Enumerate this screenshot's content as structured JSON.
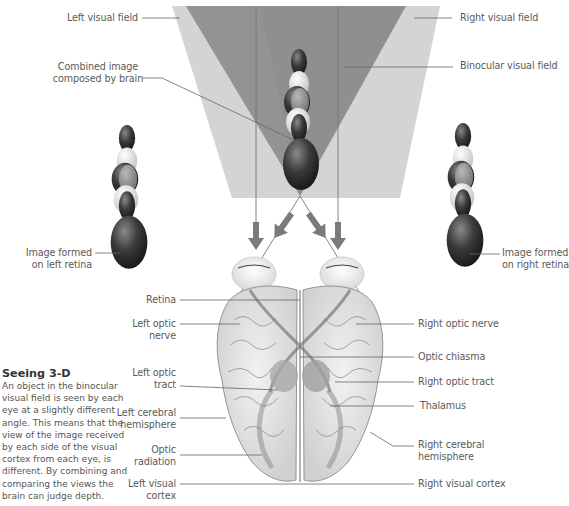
{
  "labels": {
    "left_visual_field": "Left visual field",
    "right_visual_field": "Right visual field",
    "binocular_visual_field": "Binocular visual field",
    "combined_image": [
      "Combined image",
      "composed by brain"
    ],
    "image_left_retina": [
      "Image formed",
      "on left retina"
    ],
    "image_right_retina": [
      "Image formed",
      "on right retina"
    ],
    "retina": "Retina",
    "left_optic_nerve": [
      "Left optic",
      "nerve"
    ],
    "left_optic_tract": [
      "Left optic",
      "tract"
    ],
    "left_cerebral_hemisphere": [
      "Left cerebral",
      "hemisphere"
    ],
    "optic_radiation": [
      "Optic",
      "radiation"
    ],
    "left_visual_cortex": [
      "Left visual",
      "cortex"
    ],
    "right_optic_nerve": "Right optic nerve",
    "optic_chiasma": "Optic chiasma",
    "right_optic_tract": "Right optic tract",
    "thalamus": "Thalamus",
    "right_cerebral_hemisphere": [
      "Right cerebral",
      "hemisphere"
    ],
    "right_visual_cortex": "Right visual cortex"
  },
  "caption": {
    "title": "Seeing 3-D",
    "body": "An object in the binocular visual field is seen by each eye at a slightly different angle. This means that the view of the image received by each side of the visual cortex from each eye, is different. By combining and comparing the views the brain can judge depth."
  },
  "colors": {
    "field_light": "#d4d4d4",
    "field_dark": "#8f8f8f",
    "leader_line": "#666666",
    "arrow": "#7a7a7a",
    "brain_outline": "#8a8a8a"
  }
}
